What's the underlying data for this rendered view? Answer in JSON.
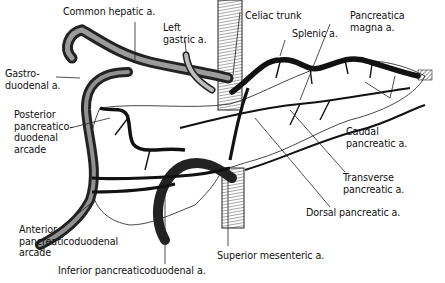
{
  "figure": {
    "colors": {
      "ink": "#111111",
      "background": "#ffffff",
      "outline": "#333333"
    },
    "labels": [
      {
        "id": "common-hepatic",
        "text": "Common hepatic a."
      },
      {
        "id": "left-gastric",
        "text": "Left\ngastric a."
      },
      {
        "id": "celiac-trunk",
        "text": "Celiac trunk"
      },
      {
        "id": "pancreatica-magna",
        "text": "Pancreatica\nmagna a."
      },
      {
        "id": "splenic",
        "text": "Splenic a."
      },
      {
        "id": "gastroduodenal",
        "text": "Gastro-\nduodenal a."
      },
      {
        "id": "posterior-pd-arcade",
        "text": "Posterior\npancreatico-\nduodenal\narcade"
      },
      {
        "id": "caudal-pancreatic",
        "text": "Caudal\npancreatic a."
      },
      {
        "id": "transverse-pancreatic",
        "text": "Transverse\npancreatic a."
      },
      {
        "id": "dorsal-pancreatic",
        "text": "Dorsal pancreatic a."
      },
      {
        "id": "anterior-pd-arcade",
        "text": "Anterior\npancreaticoduodenal\narcade"
      },
      {
        "id": "superior-mesenteric",
        "text": "Superior mesenteric a."
      },
      {
        "id": "inferior-pd",
        "text": "Inferior pancreaticoduodenal a."
      }
    ]
  }
}
